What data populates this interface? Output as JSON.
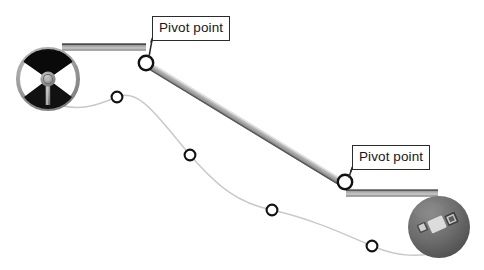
{
  "figure": {
    "type": "technical-illustration",
    "background_color": "#ffffff",
    "width": 484,
    "height": 270
  },
  "callouts": [
    {
      "id": "upper",
      "label": "Pivot point",
      "points_to": "upper-pivot-joint",
      "x": 152,
      "y": 16
    },
    {
      "id": "lower",
      "label": "Pivot point",
      "points_to": "lower-pivot-joint",
      "x": 352,
      "y": 145
    }
  ],
  "components": {
    "steering_wheel": {
      "name": "steering-wheel",
      "center_x": 48,
      "center_y": 79,
      "radius": 32,
      "rim_color": "#9a9a9a",
      "sector_color": "#111111",
      "hub_color": "#8e8e8e"
    },
    "upper_shaft": {
      "name": "upper-steering-shaft",
      "from_x": 62,
      "from_y": 47,
      "to_x": 143,
      "to_y": 47,
      "color": "#b4b4b4",
      "edge_color": "#5e5e5e"
    },
    "intermediate_rod": {
      "name": "intermediate-linkage-rod",
      "from_x": 152,
      "from_y": 69,
      "to_x": 338,
      "to_y": 182,
      "color": "#b0b0b0",
      "edge_color": "#6a6a6a"
    },
    "lower_shaft": {
      "name": "lower-steering-shaft",
      "from_x": 352,
      "from_y": 193,
      "to_x": 433,
      "to_y": 193,
      "color": "#b4b4b4",
      "edge_color": "#6b6b6b"
    },
    "gearbox": {
      "name": "steering-gearbox",
      "center_x": 439,
      "center_y": 227,
      "radius": 31,
      "body_color": "#6f6f6f",
      "detail_color": "#d8d8d8"
    }
  },
  "pivots": [
    {
      "name": "upper-pivot-joint",
      "x": 146,
      "y": 63,
      "radius": 7.2
    },
    {
      "name": "lower-pivot-joint",
      "x": 345,
      "y": 182,
      "radius": 7.2
    }
  ],
  "cable": {
    "name": "wiring-harness-curve",
    "color": "#c9c9c9",
    "clip_markers": [
      {
        "name": "harness-clip-1",
        "x": 117,
        "y": 97,
        "radius": 5.4
      },
      {
        "name": "harness-clip-2",
        "x": 190,
        "y": 155,
        "radius": 5.4
      },
      {
        "name": "harness-clip-3",
        "x": 272,
        "y": 210,
        "radius": 5.4
      },
      {
        "name": "harness-clip-4",
        "x": 372,
        "y": 246,
        "radius": 5.4
      }
    ]
  }
}
